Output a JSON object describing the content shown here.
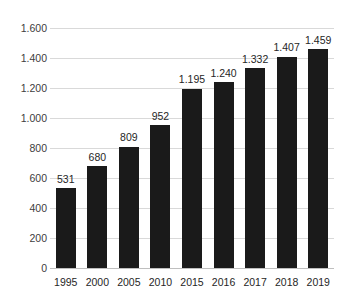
{
  "chart_data": {
    "type": "bar",
    "title": "",
    "subtitle": "",
    "xlabel": "",
    "ylabel": "",
    "categories": [
      "1995",
      "2000",
      "2005",
      "2010",
      "2015",
      "2016",
      "2017",
      "2018",
      "2019"
    ],
    "values": [
      531,
      680,
      809,
      952,
      1195,
      1240,
      1332,
      1407,
      1459
    ],
    "value_labels": [
      "531",
      "680",
      "809",
      "952",
      "1.195",
      "1.240",
      "1.332",
      "1.407",
      "1.459"
    ],
    "ylim": [
      0,
      1600
    ],
    "ytick_values": [
      0,
      200,
      400,
      600,
      800,
      1000,
      1200,
      1400,
      1600
    ],
    "ytick_labels": [
      "0",
      "200",
      "400",
      "600",
      "800",
      "1.000",
      "1.200",
      "1.400",
      "1.600"
    ],
    "grid": true,
    "grid_axis": "y",
    "legend": null,
    "legend_position": "none",
    "bar_color": "#1a1a1a",
    "grid_color": "#d9d9d9",
    "axis_color": "#bfbfbf",
    "label_color": "#262626",
    "tick_color": "#404040",
    "background_color": "#ffffff",
    "number_format": "european-thousands-dot",
    "series": [
      {
        "name": "",
        "values": [
          531,
          680,
          809,
          952,
          1195,
          1240,
          1332,
          1407,
          1459
        ]
      }
    ]
  }
}
